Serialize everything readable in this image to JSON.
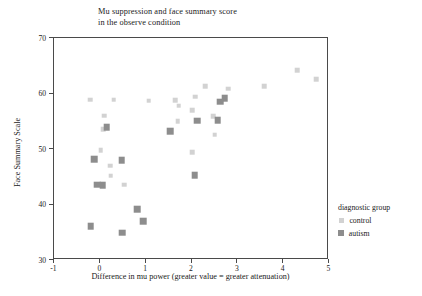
{
  "chart_data": {
    "type": "scatter",
    "title": "Mu suppression and face summary score\nin the observe condition",
    "xlabel": "Difference in mu power (greater value = greater attenuation)",
    "ylabel": "Face Summary Scale",
    "xlim": [
      -1,
      5
    ],
    "ylim": [
      30,
      70
    ],
    "xticks": [
      -1,
      0,
      1,
      2,
      3,
      4,
      5
    ],
    "yticks": [
      30,
      40,
      50,
      60,
      70
    ],
    "xtick_labels": [
      "-1",
      "0",
      "1",
      "2",
      "3",
      "4",
      "5"
    ],
    "ytick_labels": [
      "30",
      "40",
      "50",
      "60",
      "70"
    ],
    "grid": false,
    "legend": {
      "title": "diagnostic group",
      "position": "right",
      "entries": [
        {
          "name": "control",
          "color": "#d2d2d2"
        },
        {
          "name": "autism",
          "color": "#8d8d8d"
        }
      ]
    },
    "series": [
      {
        "name": "control",
        "color": "#d2d2d2",
        "marker": "square",
        "points": [
          {
            "x": -0.21,
            "y": 58.9
          },
          {
            "x": 0.3,
            "y": 58.9
          },
          {
            "x": 0.1,
            "y": 56.0
          },
          {
            "x": 0.07,
            "y": 53.6
          },
          {
            "x": 0.02,
            "y": 49.8
          },
          {
            "x": 0.22,
            "y": 47.0
          },
          {
            "x": 0.24,
            "y": 45.2
          },
          {
            "x": 0.53,
            "y": 43.6
          },
          {
            "x": 1.07,
            "y": 58.7
          },
          {
            "x": 1.65,
            "y": 58.8
          },
          {
            "x": 1.72,
            "y": 57.8
          },
          {
            "x": 1.7,
            "y": 55.0
          },
          {
            "x": 2.08,
            "y": 59.4
          },
          {
            "x": 2.02,
            "y": 57.0
          },
          {
            "x": 2.3,
            "y": 61.3
          },
          {
            "x": 2.47,
            "y": 55.9
          },
          {
            "x": 2.51,
            "y": 52.6
          },
          {
            "x": 2.8,
            "y": 60.9
          },
          {
            "x": 3.58,
            "y": 61.3
          },
          {
            "x": 4.3,
            "y": 64.2
          },
          {
            "x": 4.72,
            "y": 62.6
          },
          {
            "x": 2.02,
            "y": 49.4
          }
        ]
      },
      {
        "name": "autism",
        "color": "#8d8d8d",
        "marker": "square",
        "points": [
          {
            "x": 0.15,
            "y": 53.9
          },
          {
            "x": -0.12,
            "y": 48.2
          },
          {
            "x": -0.06,
            "y": 43.6
          },
          {
            "x": 0.06,
            "y": 43.5
          },
          {
            "x": 0.48,
            "y": 48.0
          },
          {
            "x": -0.2,
            "y": 36.1
          },
          {
            "x": 0.49,
            "y": 34.9
          },
          {
            "x": 0.81,
            "y": 39.2
          },
          {
            "x": 0.95,
            "y": 37.0
          },
          {
            "x": 1.53,
            "y": 53.2
          },
          {
            "x": 2.07,
            "y": 45.3
          },
          {
            "x": 2.12,
            "y": 55.1
          },
          {
            "x": 2.57,
            "y": 55.2
          },
          {
            "x": 2.72,
            "y": 59.2
          },
          {
            "x": 2.62,
            "y": 58.5
          }
        ]
      }
    ]
  }
}
